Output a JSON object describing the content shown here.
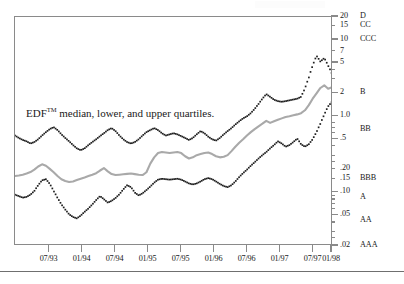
{
  "figure": {
    "annotation": "EDF median, lower, and upper quartiles.",
    "annotation_prefix": "EDF",
    "annotation_superscript": "TM",
    "annotation_rest": " median, lower, and upper quartiles."
  },
  "colors": {
    "median_line": "#a9a9a9",
    "quartile_dots": "#1f1f1f",
    "axis": "#8a8a8a",
    "text": "#1a1a1a",
    "background": "#ffffff"
  },
  "chart_data": {
    "type": "line",
    "title": "",
    "subtitle": "",
    "xlabel": "",
    "ylabel": "",
    "annotations": [
      "EDF™ median, lower, and upper quartiles."
    ],
    "grid": false,
    "legend_position": "none",
    "yscale": "log",
    "ylim": [
      0.02,
      20
    ],
    "y_tick_values": [
      20,
      15,
      10,
      7,
      5,
      2,
      1.0,
      0.5,
      0.2,
      0.15,
      0.1,
      0.05,
      0.02
    ],
    "y_tick_labels": [
      "20",
      "15",
      "10",
      "7",
      "5",
      "2",
      "1.0",
      ".5",
      ".20",
      ".15",
      ".10",
      ".05",
      ".02"
    ],
    "y_secondary_axis_label": "Credit rating equivalent",
    "rating_scale": [
      {
        "label": "D",
        "edf": 20
      },
      {
        "label": "CC",
        "edf": 15
      },
      {
        "label": "CCC",
        "edf": 10
      },
      {
        "label": "B",
        "edf": 2
      },
      {
        "label": "BB",
        "edf": 0.65
      },
      {
        "label": "BBB",
        "edf": 0.15
      },
      {
        "label": "A",
        "edf": 0.085
      },
      {
        "label": "AA",
        "edf": 0.042
      },
      {
        "label": "AAA",
        "edf": 0.02
      }
    ],
    "x_tick_labels": [
      "07/93",
      "01/94",
      "07/94",
      "01/95",
      "07/95",
      "01/96",
      "07/96",
      "01/97",
      "07/97",
      "01/98"
    ],
    "x_tick_positions": [
      0.1087,
      0.2128,
      0.317,
      0.4211,
      0.5253,
      0.6294,
      0.7336,
      0.8377,
      0.9419,
      1.0
    ],
    "x_range_start": "01/93",
    "x_range_end": "06/98",
    "series": [
      {
        "name": "upper quartile",
        "style": "dotted",
        "color": "#1f1f1f",
        "values": [
          0.56,
          0.52,
          0.49,
          0.47,
          0.44,
          0.46,
          0.5,
          0.56,
          0.62,
          0.68,
          0.72,
          0.66,
          0.58,
          0.52,
          0.47,
          0.42,
          0.38,
          0.36,
          0.38,
          0.42,
          0.46,
          0.5,
          0.55,
          0.6,
          0.66,
          0.7,
          0.64,
          0.56,
          0.5,
          0.46,
          0.44,
          0.46,
          0.5,
          0.56,
          0.62,
          0.66,
          0.7,
          0.66,
          0.6,
          0.56,
          0.58,
          0.6,
          0.58,
          0.55,
          0.52,
          0.49,
          0.52,
          0.58,
          0.64,
          0.6,
          0.54,
          0.5,
          0.48,
          0.52,
          0.58,
          0.64,
          0.7,
          0.78,
          0.86,
          0.94,
          1.0,
          1.1,
          1.25,
          1.45,
          1.7,
          1.95,
          1.8,
          1.65,
          1.58,
          1.55,
          1.58,
          1.62,
          1.66,
          1.7,
          1.8,
          2.3,
          3.2,
          4.6,
          6.2,
          5.2,
          5.8,
          4.6,
          3.6
        ]
      },
      {
        "name": "median",
        "style": "solid",
        "color": "#a9a9a9",
        "values": [
          0.165,
          0.168,
          0.172,
          0.178,
          0.186,
          0.2,
          0.22,
          0.235,
          0.225,
          0.205,
          0.185,
          0.165,
          0.15,
          0.142,
          0.138,
          0.14,
          0.146,
          0.152,
          0.158,
          0.165,
          0.172,
          0.18,
          0.195,
          0.21,
          0.19,
          0.175,
          0.17,
          0.172,
          0.174,
          0.176,
          0.178,
          0.175,
          0.172,
          0.17,
          0.185,
          0.24,
          0.29,
          0.33,
          0.34,
          0.335,
          0.33,
          0.335,
          0.34,
          0.33,
          0.3,
          0.28,
          0.29,
          0.31,
          0.32,
          0.33,
          0.335,
          0.32,
          0.3,
          0.29,
          0.295,
          0.31,
          0.35,
          0.4,
          0.45,
          0.5,
          0.56,
          0.62,
          0.68,
          0.74,
          0.8,
          0.87,
          0.82,
          0.86,
          0.9,
          0.94,
          0.98,
          1.0,
          1.03,
          1.06,
          1.1,
          1.2,
          1.4,
          1.7,
          2.0,
          2.35,
          2.55,
          2.3,
          2.4
        ]
      },
      {
        "name": "lower quartile",
        "style": "dotted",
        "color": "#1f1f1f",
        "values": [
          0.094,
          0.09,
          0.086,
          0.088,
          0.094,
          0.105,
          0.125,
          0.145,
          0.15,
          0.13,
          0.105,
          0.085,
          0.07,
          0.06,
          0.052,
          0.048,
          0.046,
          0.05,
          0.056,
          0.062,
          0.07,
          0.08,
          0.09,
          0.082,
          0.074,
          0.078,
          0.085,
          0.095,
          0.11,
          0.125,
          0.118,
          0.1,
          0.092,
          0.098,
          0.108,
          0.12,
          0.135,
          0.148,
          0.152,
          0.15,
          0.148,
          0.15,
          0.152,
          0.148,
          0.14,
          0.132,
          0.128,
          0.132,
          0.14,
          0.15,
          0.155,
          0.15,
          0.14,
          0.13,
          0.122,
          0.118,
          0.125,
          0.14,
          0.16,
          0.18,
          0.2,
          0.225,
          0.25,
          0.28,
          0.31,
          0.34,
          0.38,
          0.42,
          0.47,
          0.44,
          0.4,
          0.42,
          0.46,
          0.51,
          0.43,
          0.4,
          0.43,
          0.5,
          0.62,
          0.8,
          1.05,
          1.35,
          1.55
        ]
      }
    ]
  }
}
